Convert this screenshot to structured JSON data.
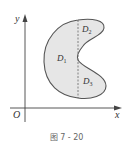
{
  "figure": {
    "caption": "图 7 - 20",
    "axes": {
      "x_label": "x",
      "y_label": "y",
      "origin_label": "O"
    },
    "regions": [
      {
        "name": "D",
        "sub": "1"
      },
      {
        "name": "D",
        "sub": "2"
      },
      {
        "name": "D",
        "sub": "3"
      }
    ],
    "colors": {
      "fill": "#e6e6e6",
      "stroke": "#555555",
      "axis": "#444444"
    }
  }
}
